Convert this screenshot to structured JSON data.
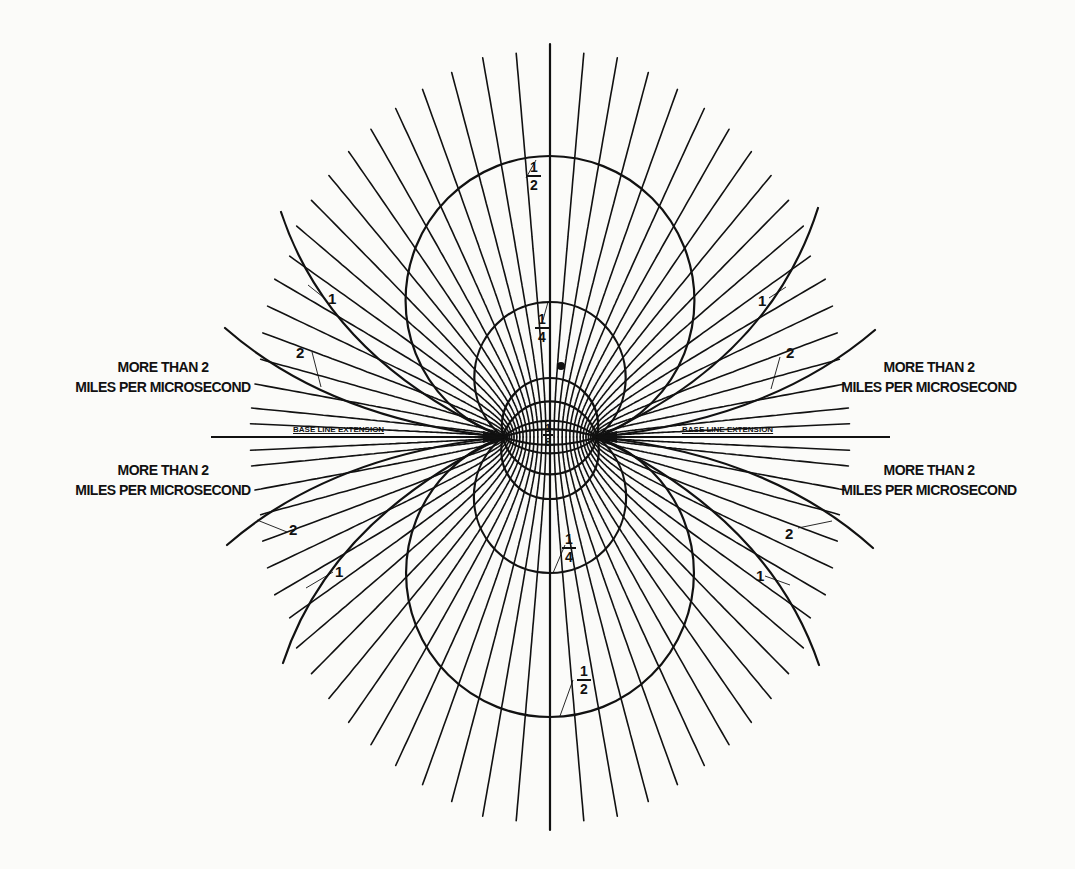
{
  "diagram": {
    "title": "",
    "foci": {
      "left": [
        503,
        437
      ],
      "right": [
        597,
        437
      ]
    },
    "colors": {
      "ink": "#111111",
      "paper": "#fbfbf9"
    },
    "baseline": {
      "left_label": "BASE LINE EXTENSION",
      "right_label": "BASE LINE EXTENSION",
      "left_x": [
        211,
        503
      ],
      "right_x": [
        597,
        890
      ],
      "y": 437
    },
    "region_labels": {
      "upper_left": {
        "line1": "MORE THAN 2",
        "line2": "MILES PER MICROSECOND"
      },
      "upper_right": {
        "line1": "MORE THAN 2",
        "line2": "MILES PER MICROSECOND"
      },
      "lower_left": {
        "line1": "MORE THAN 2",
        "line2": "MILES PER MICROSECOND"
      },
      "lower_right": {
        "line1": "MORE THAN 2",
        "line2": "MILES PER MICROSECOND"
      }
    },
    "contours": [
      {
        "value": "1/8",
        "num": "1",
        "den": "8",
        "top_y": 378,
        "bottom_y": 499
      },
      {
        "value": "1/4",
        "num": "1",
        "den": "4",
        "top_y": 302,
        "bottom_y": 573
      },
      {
        "value": "1/2",
        "num": "1",
        "den": "2",
        "top_y": 156,
        "bottom_y": 717
      }
    ],
    "side_contours": [
      {
        "value": "1",
        "label": "1"
      },
      {
        "value": "2",
        "label": "2"
      }
    ],
    "radial_line_count": 37
  }
}
